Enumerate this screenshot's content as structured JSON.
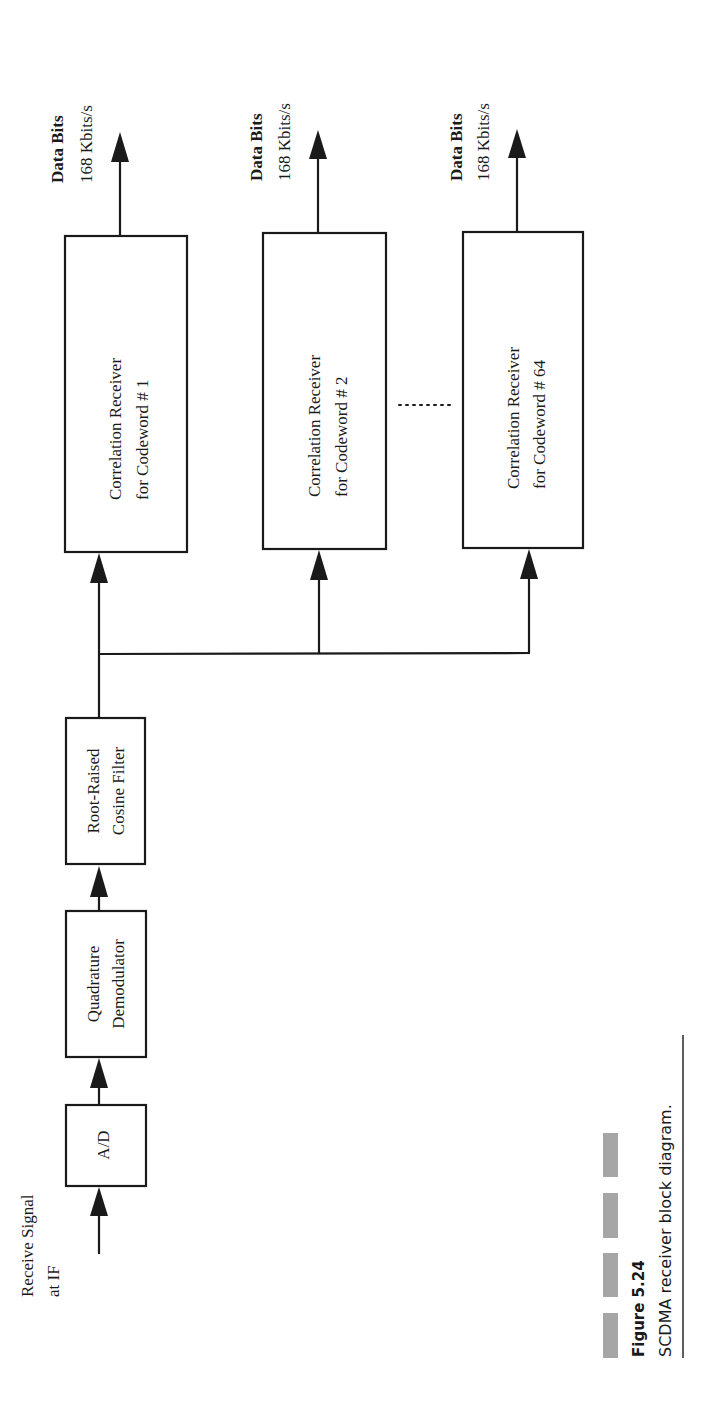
{
  "figure": {
    "number": "Figure 5.24",
    "caption": "SCDMA receiver block diagram.",
    "orientation": "rotated 90° counter-clockwise (landscape figure on portrait page)"
  },
  "input": {
    "label_line1": "Receive Signal",
    "label_line2": "at IF"
  },
  "chain": [
    {
      "id": "ad",
      "label_line1": "A/D",
      "label_line2": ""
    },
    {
      "id": "quad-demod",
      "label_line1": "Quadrature",
      "label_line2": "Demodulator"
    },
    {
      "id": "rrc-filter",
      "label_line1": "Root-Raised",
      "label_line2": "Cosine Filter"
    }
  ],
  "receivers": [
    {
      "label_line1": "Correlation Receiver",
      "label_line2": "for Codeword # 1",
      "output_line1": "Data Bits",
      "output_line2": "168 Kbits/s"
    },
    {
      "label_line1": "Correlation Receiver",
      "label_line2": "for Codeword # 2",
      "output_line1": "Data Bits",
      "output_line2": "168 Kbits/s"
    },
    {
      "label_line1": "Correlation Receiver",
      "label_line2": "for Codeword # 64",
      "output_line1": "Data Bits",
      "output_line2": "168 Kbits/s"
    }
  ],
  "ellipsis": "........",
  "colors": {
    "ink": "#1a1a1a",
    "caption_blocks": "#a6a6a6",
    "background": "#ffffff"
  }
}
